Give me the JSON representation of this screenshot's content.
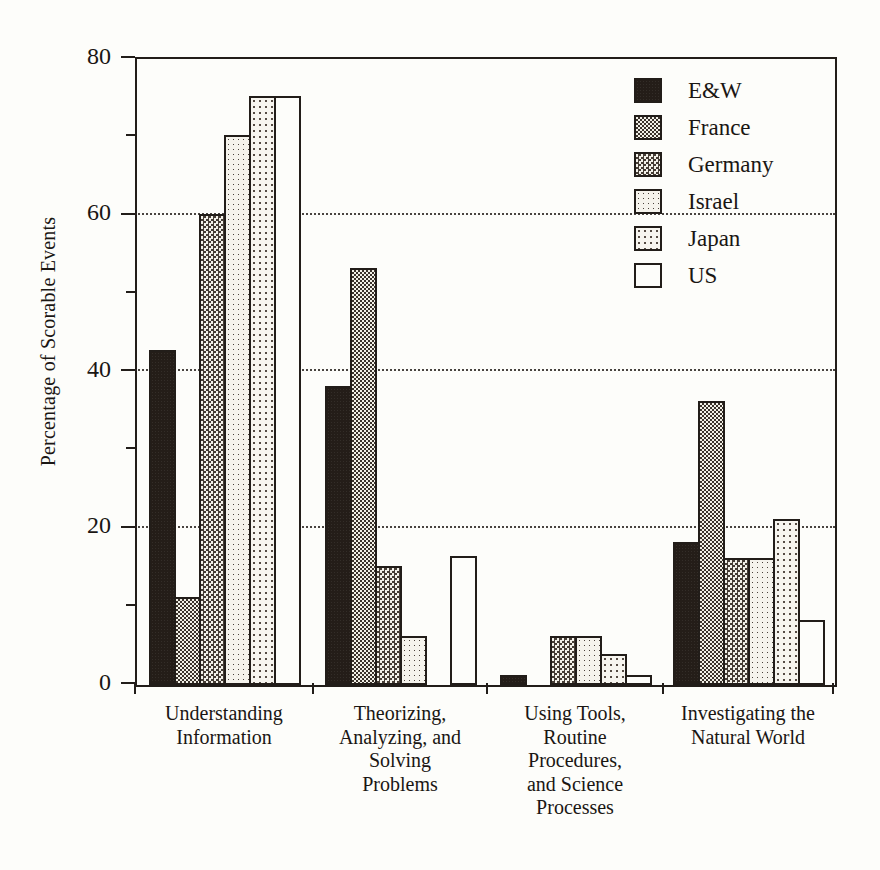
{
  "chart_data": {
    "type": "bar",
    "title": "",
    "xlabel": "",
    "ylabel": "Percentage of Scorable Events",
    "ylim": [
      0,
      80
    ],
    "yticks": [
      0,
      20,
      40,
      60,
      80
    ],
    "yminorticks": [
      10,
      30,
      50,
      70
    ],
    "grid": "horizontal dotted at 20, 40, 60",
    "legend_position": "top-right inside plot",
    "categories": [
      "Understanding\nInformation",
      "Theorizing,\nAnalyzing, and\nSolving\nProblems",
      "Using Tools,\nRoutine\nProcedures,\nand Science\nProcesses",
      "Investigating the\nNatural World"
    ],
    "series": [
      {
        "name": "E&W",
        "pattern": "solid",
        "color": "#241d18",
        "values": [
          42.5,
          38,
          1,
          18
        ]
      },
      {
        "name": "France",
        "pattern": "dense",
        "color": "#3a322b",
        "values": [
          11,
          53,
          0,
          36
        ]
      },
      {
        "name": "Germany",
        "pattern": "med",
        "color": "#463d35",
        "values": [
          60,
          15,
          6,
          16
        ]
      },
      {
        "name": "Israel",
        "pattern": "light",
        "color": "#4a413a",
        "values": [
          70,
          6,
          6,
          16
        ]
      },
      {
        "name": "Japan",
        "pattern": "faint",
        "color": "#554b43",
        "values": [
          75,
          0,
          3.7,
          21
        ]
      },
      {
        "name": "US",
        "pattern": "empty",
        "color": "#fdfdfa",
        "values": [
          75,
          16.2,
          1,
          8
        ]
      }
    ]
  },
  "axis": {
    "y_title": "Percentage of Scorable Events",
    "y_tick_labels": [
      "80",
      "60",
      "40",
      "20",
      "0"
    ]
  },
  "legend": {
    "entries": [
      {
        "label": "E&W"
      },
      {
        "label": "France"
      },
      {
        "label": "Germany"
      },
      {
        "label": "Israel"
      },
      {
        "label": "Japan"
      },
      {
        "label": "US"
      }
    ]
  },
  "style": {
    "ink": "#221d19",
    "paper": "#fdfdfa",
    "grid": "#2a2420"
  }
}
